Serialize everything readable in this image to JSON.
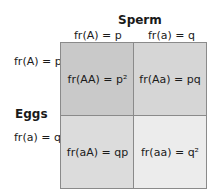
{
  "diagram": {
    "type": "punnett-square",
    "column_header": "Sperm",
    "row_header": "Eggs",
    "columns": [
      {
        "allele": "A",
        "label": "fr(A) = p"
      },
      {
        "allele": "a",
        "label": "fr(a) = q"
      }
    ],
    "rows": [
      {
        "allele": "A",
        "label": "fr(A) = p"
      },
      {
        "allele": "a",
        "label": "fr(a) = q"
      }
    ],
    "cells": [
      {
        "genotype": "AA",
        "label": "fr(AA) = p²",
        "color": "#c9c9c9"
      },
      {
        "genotype": "Aa",
        "label": "fr(Aa) = pq",
        "color": "#d6d6d6"
      },
      {
        "genotype": "aA",
        "label": "fr(aA) = qp",
        "color": "#dcdcdc"
      },
      {
        "genotype": "aa",
        "label": "fr(aa) = q²",
        "color": "#ececec"
      }
    ]
  }
}
